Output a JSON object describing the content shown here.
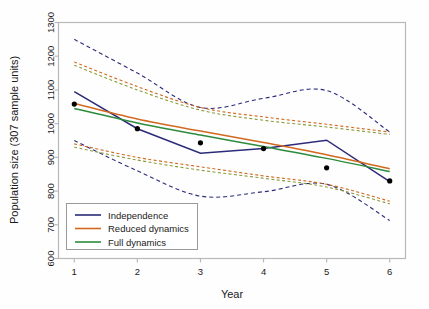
{
  "chart_data": {
    "type": "line",
    "title": "",
    "xlabel": "Year",
    "ylabel": "Population size (307 sample units)",
    "x": [
      1,
      2,
      3,
      4,
      5,
      6
    ],
    "xtick_labels": [
      "1",
      "2",
      "3",
      "4",
      "5",
      "6"
    ],
    "ytick_labels": [
      "600",
      "700",
      "800",
      "900",
      "1000",
      "1100",
      "1200",
      "1300"
    ],
    "ytick_values": [
      600,
      700,
      800,
      900,
      1000,
      1100,
      1200,
      1300
    ],
    "xlim": [
      0.75,
      6.25
    ],
    "ylim": [
      600,
      1300
    ],
    "grid": false,
    "legend_position": "bottom-left",
    "observed_points": {
      "name": "Observed population size",
      "marker": "filled-circle",
      "color": "#000000",
      "x": [
        1,
        2,
        3,
        4,
        5,
        6
      ],
      "values": [
        1058,
        985,
        943,
        926,
        869,
        830
      ]
    },
    "series": [
      {
        "name": "Independence",
        "color": "#2b2b7a",
        "style": "solid",
        "values": [
          1095,
          985,
          912,
          926,
          951,
          828
        ]
      },
      {
        "name": "Reduced dynamics",
        "color": "#d2691e",
        "style": "solid",
        "values": [
          1060,
          1014,
          978,
          944,
          908,
          866
        ]
      },
      {
        "name": "Full dynamics",
        "color": "#2e8b3d",
        "style": "solid",
        "values": [
          1045,
          1002,
          966,
          932,
          897,
          858
        ]
      }
    ],
    "confidence_bands": [
      {
        "name": "Independence upper",
        "color": "#2b2b7a",
        "style": "dashed",
        "values": [
          1250,
          1150,
          1048,
          1075,
          1098,
          975
        ]
      },
      {
        "name": "Independence lower",
        "color": "#2b2b7a",
        "style": "dashed",
        "values": [
          950,
          860,
          785,
          798,
          820,
          713
        ]
      },
      {
        "name": "Reduced dynamics upper",
        "color": "#d2691e",
        "style": "dashed",
        "values": [
          1183,
          1110,
          1048,
          1020,
          998,
          975
        ]
      },
      {
        "name": "Reduced dynamics lower",
        "color": "#d2691e",
        "style": "dashed",
        "values": [
          940,
          900,
          872,
          845,
          820,
          770
        ]
      },
      {
        "name": "Full dynamics upper",
        "color": "#8a9b3a",
        "style": "dashed",
        "values": [
          1173,
          1100,
          1040,
          1010,
          990,
          968
        ]
      },
      {
        "name": "Full dynamics lower",
        "color": "#8a9b3a",
        "style": "dashed",
        "values": [
          930,
          892,
          862,
          838,
          812,
          762
        ]
      }
    ],
    "legend": [
      {
        "label": "Independence",
        "color": "#2b2b7a"
      },
      {
        "label": "Reduced dynamics",
        "color": "#d2691e"
      },
      {
        "label": "Full dynamics",
        "color": "#2e8b3d"
      }
    ]
  }
}
